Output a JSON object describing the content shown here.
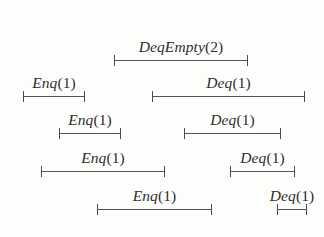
{
  "figure": {
    "type": "interval-timeline",
    "background_color": "#fdfdfc",
    "line_color": "#555456",
    "text_color": "#2f2e30",
    "width": 324,
    "height": 237
  },
  "intervals": [
    {
      "id": "deqempty-2-row1",
      "op": "DeqEmpty",
      "arg": "(2)",
      "label": "DeqEmpty(2)",
      "row": 1,
      "x_start": 114,
      "x_end": 248,
      "y": 60
    },
    {
      "id": "enq-1-row2",
      "op": "Enq",
      "arg": "(1)",
      "label": "Enq(1)",
      "row": 2,
      "x_start": 23,
      "x_end": 85,
      "y": 96
    },
    {
      "id": "deq-1-row2",
      "op": "Deq",
      "arg": "(1)",
      "label": "Deq(1)",
      "row": 2,
      "x_start": 152,
      "x_end": 305,
      "y": 96
    },
    {
      "id": "enq-1-row3",
      "op": "Enq",
      "arg": "(1)",
      "label": "Enq(1)",
      "row": 3,
      "x_start": 59,
      "x_end": 121,
      "y": 133
    },
    {
      "id": "deq-1-row3",
      "op": "Deq",
      "arg": "(1)",
      "label": "Deq(1)",
      "row": 3,
      "x_start": 184,
      "x_end": 281,
      "y": 133
    },
    {
      "id": "enq-1-row4",
      "op": "Enq",
      "arg": "(1)",
      "label": "Enq(1)",
      "row": 4,
      "x_start": 41,
      "x_end": 165,
      "y": 171
    },
    {
      "id": "deq-1-row4",
      "op": "Deq",
      "arg": "(1)",
      "label": "Deq(1)",
      "row": 4,
      "x_start": 230,
      "x_end": 295,
      "y": 171
    },
    {
      "id": "enq-1-row5",
      "op": "Enq",
      "arg": "(1)",
      "label": "Enq(1)",
      "row": 5,
      "x_start": 97,
      "x_end": 212,
      "y": 209
    },
    {
      "id": "deq-1-row5",
      "op": "Deq",
      "arg": "(1)",
      "label": "Deq(1)",
      "row": 5,
      "x_start": 277,
      "x_end": 307,
      "y": 209
    }
  ]
}
